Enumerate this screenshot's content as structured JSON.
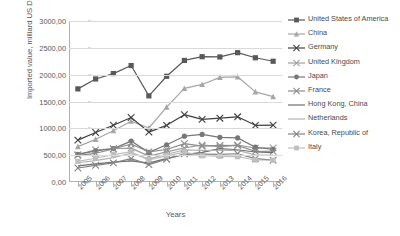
{
  "chart_data": {
    "type": "line",
    "title": "",
    "xlabel": "Years",
    "ylabel": "Imported value, milliard US Dollar",
    "grid": true,
    "legend_position": "right",
    "ylim": [
      0,
      3000
    ],
    "ytick_step": 500,
    "ytick_labels": [
      "3000,00",
      "2500,00",
      "2000,00",
      "1500,00",
      "1000,00",
      "500,00",
      "0,00"
    ],
    "ytick_values": [
      3000,
      2500,
      2000,
      1500,
      1000,
      500,
      0
    ],
    "categories": [
      "2005",
      "2006",
      "2007",
      "2008",
      "2009",
      "2010",
      "2011",
      "2012",
      "2013",
      "2014",
      "2015",
      "2016"
    ],
    "series": [
      {
        "name": "United States of America",
        "color": "#595959",
        "marker": "square",
        "values": [
          1735,
          1920,
          2020,
          2170,
          1605,
          1970,
          2265,
          2335,
          2330,
          2410,
          2315,
          2250
        ]
      },
      {
        "name": "China",
        "color": "#a6a6a6",
        "marker": "triangle",
        "values": [
          660,
          795,
          956,
          1132,
          1006,
          1396,
          1743,
          1818,
          1950,
          1960,
          1680,
          1590
        ]
      },
      {
        "name": "Germany",
        "color": "#404040",
        "marker": "cross",
        "values": [
          780,
          922,
          1058,
          1202,
          930,
          1056,
          1255,
          1167,
          1189,
          1215,
          1056,
          1060
        ]
      },
      {
        "name": "United Kingdom",
        "color": "#9e9e9e",
        "marker": "cross",
        "values": [
          510,
          600,
          620,
          632,
          483,
          560,
          637,
          690,
          655,
          690,
          630,
          636
        ]
      },
      {
        "name": "Japan",
        "color": "#777777",
        "marker": "circle",
        "values": [
          515,
          580,
          622,
          762,
          552,
          694,
          854,
          886,
          833,
          822,
          648,
          607
        ]
      },
      {
        "name": "France",
        "color": "#8c8c8c",
        "marker": "cross",
        "values": [
          496,
          535,
          615,
          708,
          560,
          606,
          715,
          667,
          681,
          678,
          572,
          573
        ]
      },
      {
        "name": "Hong Kong, China",
        "color": "#6e6e6e",
        "marker": "none",
        "values": [
          300,
          336,
          370,
          393,
          352,
          441,
          511,
          553,
          621,
          601,
          559,
          547
        ]
      },
      {
        "name": "Netherlands",
        "color": "#b3b3b3",
        "marker": "none",
        "values": [
          359,
          400,
          455,
          536,
          430,
          517,
          597,
          591,
          590,
          588,
          506,
          503
        ]
      },
      {
        "name": "Korea, Republic of",
        "color": "#828282",
        "marker": "cross",
        "values": [
          261,
          309,
          357,
          435,
          323,
          425,
          524,
          520,
          516,
          526,
          436,
          406
        ]
      },
      {
        "name": "Italy",
        "color": "#bfbfbf",
        "marker": "square",
        "values": [
          384,
          442,
          511,
          560,
          413,
          487,
          557,
          489,
          479,
          472,
          410,
          405
        ]
      }
    ]
  },
  "legend": {
    "items": [
      "United States of America",
      "China",
      "Germany",
      "United Kingdom",
      "Japan",
      "France",
      "Hong Kong, China",
      "Netherlands",
      "Korea, Republic of",
      "Italy"
    ]
  }
}
